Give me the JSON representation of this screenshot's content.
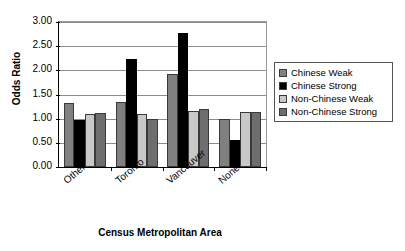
{
  "chart_data": {
    "type": "bar",
    "title": "",
    "subtitle": "",
    "xlabel": "Census Metropolitan Area",
    "ylabel": "Odds Ratio",
    "categories": [
      "Other",
      "Toronto",
      "Vancouver",
      "None"
    ],
    "series": [
      {
        "name": "Chinese Weak",
        "color": "#808080",
        "values": [
          1.33,
          1.35,
          1.93,
          1.0
        ]
      },
      {
        "name": "Chinese Strong",
        "color": "#000000",
        "values": [
          0.97,
          2.23,
          2.77,
          0.55
        ]
      },
      {
        "name": "Non-Chinese Weak",
        "color": "#c8c8c8",
        "values": [
          1.1,
          1.1,
          1.16,
          1.13
        ]
      },
      {
        "name": "Non-Chinese Strong",
        "color": "#6e6e6e",
        "values": [
          1.11,
          1.0,
          1.2,
          1.13
        ]
      }
    ],
    "ylim": [
      0.0,
      3.0
    ],
    "ytick_step": 0.5,
    "ytick_labels": [
      "0.00",
      "0.50",
      "1.00",
      "1.50",
      "2.00",
      "2.50",
      "3.00"
    ],
    "grid": true,
    "legend_position": "right"
  },
  "legend": {
    "entries": [
      {
        "label": "Chinese Weak"
      },
      {
        "label": "Chinese Strong"
      },
      {
        "label": "Non-Chinese Weak"
      },
      {
        "label": "Non-Chinese Strong"
      }
    ]
  }
}
